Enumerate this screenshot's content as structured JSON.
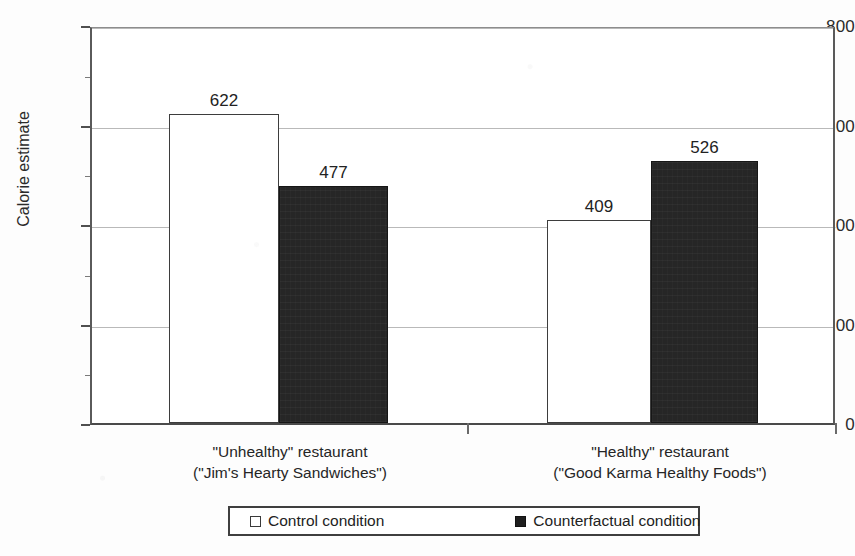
{
  "chart_data": {
    "type": "bar",
    "title": "",
    "subtitle": "",
    "xlabel": "",
    "ylabel": "Calorie estimate",
    "ylim": [
      0,
      800
    ],
    "yticks": [
      0,
      200,
      400,
      600,
      800
    ],
    "ytick_labels": [
      "0",
      "200",
      "400",
      "600",
      "800"
    ],
    "minor_tick_interval": 100,
    "grid": true,
    "grid_axis": "y",
    "legend_position": "bottom",
    "categories": [
      "\"Unhealthy\" restaurant (\"Jim's Hearty Sandwiches\")",
      "\"Healthy\" restaurant (\"Good Karma Healthy Foods\")"
    ],
    "series": [
      {
        "name": "Control condition",
        "color": "#ffffff",
        "edge_color": "#3d3d3d",
        "values": [
          622,
          409
        ],
        "value_labels": [
          "622",
          "409"
        ]
      },
      {
        "name": "Counterfactual condition",
        "color": "#262626",
        "edge_color": "#161616",
        "values": [
          477,
          526
        ],
        "value_labels": [
          "477",
          "526"
        ]
      }
    ]
  },
  "axes": {
    "y_title": "Calorie estimate",
    "y_tick_labels": [
      "800",
      "600",
      "400",
      "200",
      "0"
    ],
    "x_categories": [
      {
        "line1": "\"Unhealthy\" restaurant",
        "line2": "(\"Jim's Hearty Sandwiches\")"
      },
      {
        "line1": "\"Healthy\" restaurant",
        "line2": "(\"Good Karma Healthy Foods\")"
      }
    ]
  },
  "bar_values": {
    "group1_control": "622",
    "group1_counterfactual": "477",
    "group2_control": "409",
    "group2_counterfactual": "526"
  },
  "legend": {
    "items": [
      {
        "label": "Control condition",
        "marker": "open-square-swatch"
      },
      {
        "label": "Counterfactual condition",
        "marker": "filled-square-swatch"
      }
    ]
  },
  "colors": {
    "control_fill": "#ffffff",
    "counterfactual_fill": "#262626",
    "axis": "#4a4a4a",
    "gridline": "#b9b9b9",
    "background": "#fdfdfd"
  }
}
